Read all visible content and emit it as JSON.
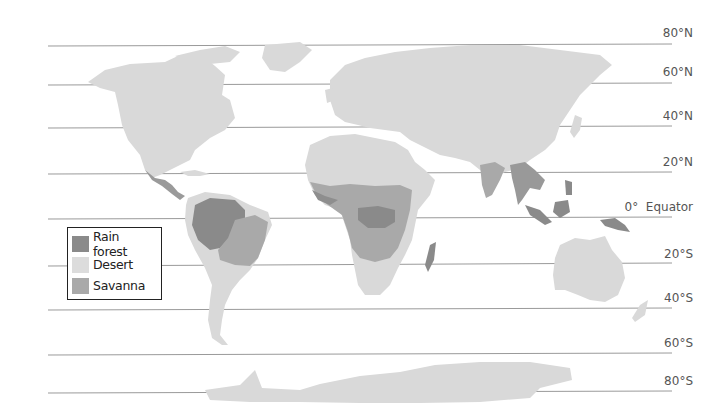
{
  "map": {
    "title": "World biomes: rain forest, desert, savanna",
    "colors": {
      "land": "#d9d9d9",
      "rain_forest": "#8a8a8a",
      "desert": "#dcdcdc",
      "savanna": "#a9a9a9",
      "grid_line": "#9a9a9a"
    },
    "latitude_lines": [
      {
        "label": "80°N",
        "y": 46
      },
      {
        "label": "60°N",
        "y": 85
      },
      {
        "label": "40°N",
        "y": 128
      },
      {
        "label": "20°N",
        "y": 174
      },
      {
        "label": "0°  Equator",
        "y": 219
      },
      {
        "label": "20°S",
        "y": 266
      },
      {
        "label": "40°S",
        "y": 310
      },
      {
        "label": "60°S",
        "y": 355
      },
      {
        "label": "80°S",
        "y": 393
      }
    ]
  },
  "legend": {
    "items": [
      {
        "label": "Rain forest",
        "color": "#8a8a8a"
      },
      {
        "label": "Desert",
        "color": "#dcdcdc"
      },
      {
        "label": "Savanna",
        "color": "#a9a9a9"
      }
    ]
  }
}
